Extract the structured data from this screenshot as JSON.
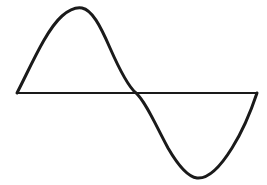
{
  "figure": {
    "background_color": "#ffffff",
    "stroke_color": "#1a1a1a",
    "axis_color": "#1a1a1a",
    "canvas": {
      "width": 267,
      "height": 185
    }
  },
  "chart_data": {
    "type": "line",
    "xlabel": "",
    "ylabel": "",
    "grid": false,
    "legend": null,
    "axis": {
      "baseline_y": 93,
      "x_start": 17,
      "x_end": 257,
      "stroke_width": 2,
      "color": "#1a1a1a"
    },
    "series": [
      {
        "name": "sine",
        "color": "#1a1a1a",
        "stroke_width": 3,
        "amplitude": 86,
        "period_px": 240,
        "x_start": 17,
        "x_end": 257,
        "key_points": {
          "start": [
            17,
            93
          ],
          "peak": [
            80,
            7
          ],
          "zero_crossing": [
            136,
            93
          ],
          "trough": [
            197,
            178
          ],
          "end": [
            257,
            93
          ]
        },
        "x": [
          17,
          27,
          37,
          47,
          57,
          67,
          77,
          87,
          97,
          107,
          117,
          127,
          137,
          147,
          157,
          167,
          177,
          187,
          197,
          207,
          217,
          227,
          237,
          247,
          257
        ],
        "y": [
          93,
          73,
          54,
          37,
          24,
          13,
          8,
          8,
          16,
          29,
          45,
          63,
          80,
          100,
          119,
          137,
          152,
          165,
          175,
          179,
          176,
          166,
          148,
          124,
          93
        ],
        "path": "M 17 93 C 30 68, 46 30, 62 16 C 70 9, 76 7, 82 8 C 92 10, 100 25, 110 48 C 121 73, 130 88, 136 93 C 146 102, 156 126, 168 148 C 179 167, 189 177, 197 178 C 207 179, 219 169, 232 148 C 244 129, 252 108, 257 93"
      }
    ],
    "xlim": [
      0,
      267
    ],
    "ylim": [
      0,
      185
    ]
  }
}
